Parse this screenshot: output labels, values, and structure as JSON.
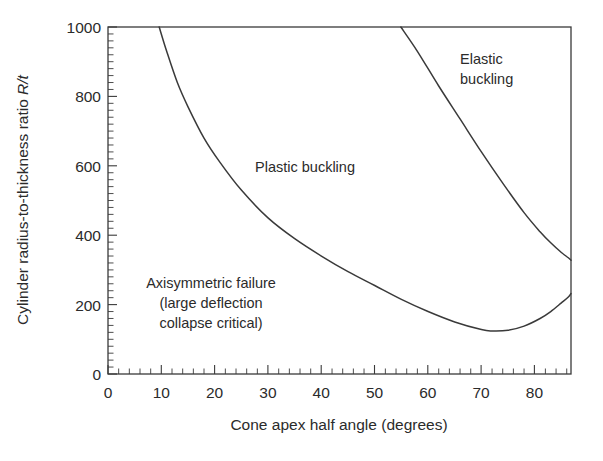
{
  "chart_data": {
    "type": "line",
    "title": "",
    "xlabel": "Cone apex half angle (degrees)",
    "ylabel": "Cylinder radius-to-thickness ratio R/t",
    "ylabel_parts": {
      "main": "Cylinder radius-to-thickness ratio ",
      "italic": "R/t"
    },
    "xlim": [
      0,
      86.8
    ],
    "ylim": [
      0,
      1000
    ],
    "grid": false,
    "legend": "none",
    "x_ticks": [
      0,
      10,
      20,
      30,
      40,
      50,
      60,
      70,
      80
    ],
    "x_tick_labels": [
      "0",
      "10",
      "20",
      "30",
      "40",
      "50",
      "60",
      "70",
      "80"
    ],
    "x_minor_tick_step": 2,
    "y_ticks": [
      0,
      200,
      400,
      600,
      800,
      1000
    ],
    "y_tick_labels": [
      "0",
      "200",
      "400",
      "600",
      "800",
      "1000"
    ],
    "y_minor_tick_step": 20,
    "series": [
      {
        "name": "axisymmetric-plastic boundary",
        "description": "Lower boundary separating axisymmetric failure from plastic buckling",
        "x": [
          9.6,
          11,
          13,
          15,
          18,
          21,
          25,
          30,
          35,
          40,
          45,
          50,
          55,
          60,
          65,
          70,
          72,
          75,
          78,
          81,
          83,
          85,
          86.3,
          86.8
        ],
        "y": [
          1000,
          930,
          840,
          770,
          680,
          610,
          530,
          450,
          390,
          340,
          295,
          255,
          215,
          180,
          150,
          128,
          124,
          126,
          138,
          160,
          180,
          205,
          222,
          232
        ]
      },
      {
        "name": "plastic-elastic boundary",
        "description": "Upper boundary separating plastic buckling from elastic buckling",
        "x": [
          54.9,
          58,
          62,
          66,
          70,
          74,
          78,
          81,
          83,
          85,
          86.3,
          86.8
        ],
        "y": [
          1000,
          930,
          830,
          735,
          640,
          550,
          465,
          410,
          378,
          350,
          335,
          328
        ]
      }
    ],
    "annotations": [
      {
        "id": "elastic",
        "text_lines": [
          "Elastic",
          "buckling"
        ],
        "x": 65,
        "y": 890
      },
      {
        "id": "plastic",
        "text_lines": [
          "Plastic buckling"
        ],
        "x": 40,
        "y": 620
      },
      {
        "id": "axisymmetric",
        "text_lines": [
          "Axisymmetric failure",
          "(large deflection",
          "collapse critical)"
        ],
        "x": 19,
        "y": 245
      }
    ],
    "colors": {
      "line": "#3a3a3a",
      "axis": "#3a3a3a",
      "text": "#2b2b2b",
      "background": "#ffffff"
    }
  },
  "labels": {
    "x_axis_title": "Cone apex half angle (degrees)",
    "y_axis_title_main": "Cylinder radius-to-thickness ratio ",
    "y_axis_title_italic": "R/t",
    "x_0": "0",
    "x_10": "10",
    "x_20": "20",
    "x_30": "30",
    "x_40": "40",
    "x_50": "50",
    "x_60": "60",
    "x_70": "70",
    "x_80": "80",
    "y_0": "0",
    "y_200": "200",
    "y_400": "400",
    "y_600": "600",
    "y_800": "800",
    "y_1000": "1000",
    "region_elastic_1": "Elastic",
    "region_elastic_2": "buckling",
    "region_plastic": "Plastic buckling",
    "region_axi_1": "Axisymmetric failure",
    "region_axi_2": "(large deflection",
    "region_axi_3": "collapse critical)"
  }
}
